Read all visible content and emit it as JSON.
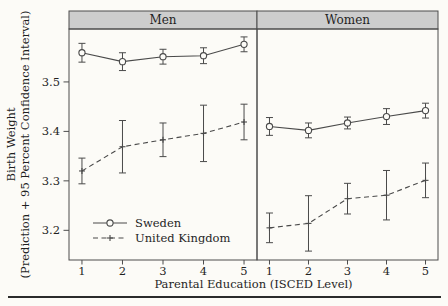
{
  "figure": {
    "background": "#fcfbf7",
    "frame_color": "#4d4d4d",
    "panel_header_fill": "#cdcdcd",
    "text_color": "#1f1f1f",
    "bottom_rule_color": "#2b2b2b"
  },
  "chart_data": {
    "type": "line",
    "facets": [
      "Men",
      "Women"
    ],
    "xlabel": "Parental Education (ISCED Level)",
    "ylabel_line1": "Birth Weight",
    "ylabel_line2": "(Prediction + 95 Percent Confidence Interval)",
    "x": [
      1,
      2,
      3,
      4,
      5
    ],
    "xticks": [
      "1",
      "2",
      "3",
      "4",
      "5"
    ],
    "yticks": [
      3.2,
      3.3,
      3.4,
      3.5
    ],
    "ytick_labels": [
      "3.2",
      "3.3",
      "3.4",
      "3.5"
    ],
    "ylim": [
      3.14,
      3.607
    ],
    "xlim": [
      0.68,
      5.32
    ],
    "grid": false,
    "legend": {
      "position": "inside-men-panel-bottom-left",
      "entries": [
        "Sweden",
        "United Kingdom"
      ]
    },
    "series": [
      {
        "name": "Sweden",
        "line": "solid",
        "marker": "circle",
        "color": "#4a4a4a",
        "facets": {
          "Men": {
            "y": [
              3.559,
              3.541,
              3.551,
              3.553,
              3.576
            ],
            "ci_low": [
              3.54,
              3.523,
              3.536,
              3.537,
              3.561
            ],
            "ci_high": [
              3.578,
              3.559,
              3.566,
              3.569,
              3.591
            ]
          },
          "Women": {
            "y": [
              3.41,
              3.402,
              3.417,
              3.43,
              3.442
            ],
            "ci_low": [
              3.392,
              3.387,
              3.405,
              3.414,
              3.427
            ],
            "ci_high": [
              3.428,
              3.417,
              3.429,
              3.446,
              3.457
            ]
          }
        }
      },
      {
        "name": "United Kingdom",
        "line": "dashed",
        "marker": "plus",
        "color": "#4a4a4a",
        "facets": {
          "Men": {
            "y": [
              3.32,
              3.369,
              3.383,
              3.396,
              3.419
            ],
            "ci_low": [
              3.294,
              3.316,
              3.349,
              3.339,
              3.383
            ],
            "ci_high": [
              3.346,
              3.422,
              3.417,
              3.453,
              3.455
            ]
          },
          "Women": {
            "y": [
              3.205,
              3.214,
              3.264,
              3.271,
              3.301
            ],
            "ci_low": [
              3.175,
              3.158,
              3.233,
              3.221,
              3.266
            ],
            "ci_high": [
              3.235,
              3.27,
              3.295,
              3.321,
              3.336
            ]
          }
        }
      }
    ]
  }
}
